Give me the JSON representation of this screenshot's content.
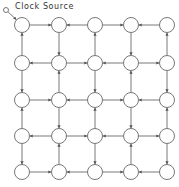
{
  "diagram": {
    "title": "Clock Source",
    "colors": {
      "stroke": "#555555",
      "background": "#ffffff"
    },
    "grid": {
      "rows": 5,
      "cols": 5
    },
    "layout": {
      "col_x": [
        22,
        59,
        95,
        131,
        167
      ],
      "row_y": [
        25,
        63,
        100,
        136,
        172
      ],
      "node_radius": 7.5,
      "source": {
        "x": 6,
        "y": 10,
        "r": 2.5
      }
    },
    "source_edge": {
      "from": "source",
      "to": [
        0,
        0
      ]
    },
    "edges": [
      {
        "from": [
          0,
          0
        ],
        "to": [
          0,
          1
        ]
      },
      {
        "from": [
          0,
          2
        ],
        "to": [
          0,
          1
        ]
      },
      {
        "from": [
          0,
          2
        ],
        "to": [
          0,
          3
        ]
      },
      {
        "from": [
          0,
          4
        ],
        "to": [
          0,
          3
        ]
      },
      {
        "from": [
          1,
          1
        ],
        "to": [
          1,
          0
        ]
      },
      {
        "from": [
          1,
          1
        ],
        "to": [
          1,
          2
        ]
      },
      {
        "from": [
          1,
          3
        ],
        "to": [
          1,
          2
        ]
      },
      {
        "from": [
          1,
          3
        ],
        "to": [
          1,
          4
        ]
      },
      {
        "from": [
          2,
          0
        ],
        "to": [
          2,
          1
        ]
      },
      {
        "from": [
          2,
          2
        ],
        "to": [
          2,
          1
        ]
      },
      {
        "from": [
          2,
          2
        ],
        "to": [
          2,
          3
        ]
      },
      {
        "from": [
          2,
          4
        ],
        "to": [
          2,
          3
        ]
      },
      {
        "from": [
          3,
          1
        ],
        "to": [
          3,
          0
        ]
      },
      {
        "from": [
          3,
          1
        ],
        "to": [
          3,
          2
        ]
      },
      {
        "from": [
          3,
          3
        ],
        "to": [
          3,
          2
        ]
      },
      {
        "from": [
          3,
          3
        ],
        "to": [
          3,
          4
        ]
      },
      {
        "from": [
          4,
          0
        ],
        "to": [
          4,
          1
        ]
      },
      {
        "from": [
          4,
          2
        ],
        "to": [
          4,
          1
        ]
      },
      {
        "from": [
          4,
          2
        ],
        "to": [
          4,
          3
        ]
      },
      {
        "from": [
          4,
          4
        ],
        "to": [
          4,
          3
        ]
      },
      {
        "from": [
          1,
          0
        ],
        "to": [
          0,
          0
        ]
      },
      {
        "from": [
          0,
          1
        ],
        "to": [
          1,
          1
        ]
      },
      {
        "from": [
          1,
          2
        ],
        "to": [
          0,
          2
        ]
      },
      {
        "from": [
          0,
          3
        ],
        "to": [
          1,
          3
        ]
      },
      {
        "from": [
          1,
          4
        ],
        "to": [
          0,
          4
        ]
      },
      {
        "from": [
          1,
          0
        ],
        "to": [
          2,
          0
        ]
      },
      {
        "from": [
          2,
          1
        ],
        "to": [
          1,
          1
        ]
      },
      {
        "from": [
          1,
          2
        ],
        "to": [
          2,
          2
        ]
      },
      {
        "from": [
          2,
          3
        ],
        "to": [
          1,
          3
        ]
      },
      {
        "from": [
          1,
          4
        ],
        "to": [
          2,
          4
        ]
      },
      {
        "from": [
          3,
          0
        ],
        "to": [
          2,
          0
        ]
      },
      {
        "from": [
          2,
          1
        ],
        "to": [
          3,
          1
        ]
      },
      {
        "from": [
          3,
          2
        ],
        "to": [
          2,
          2
        ]
      },
      {
        "from": [
          2,
          3
        ],
        "to": [
          3,
          3
        ]
      },
      {
        "from": [
          3,
          4
        ],
        "to": [
          2,
          4
        ]
      },
      {
        "from": [
          3,
          0
        ],
        "to": [
          4,
          0
        ]
      },
      {
        "from": [
          4,
          1
        ],
        "to": [
          3,
          1
        ]
      },
      {
        "from": [
          3,
          2
        ],
        "to": [
          4,
          2
        ]
      },
      {
        "from": [
          4,
          3
        ],
        "to": [
          3,
          3
        ]
      },
      {
        "from": [
          3,
          4
        ],
        "to": [
          4,
          4
        ]
      }
    ]
  }
}
